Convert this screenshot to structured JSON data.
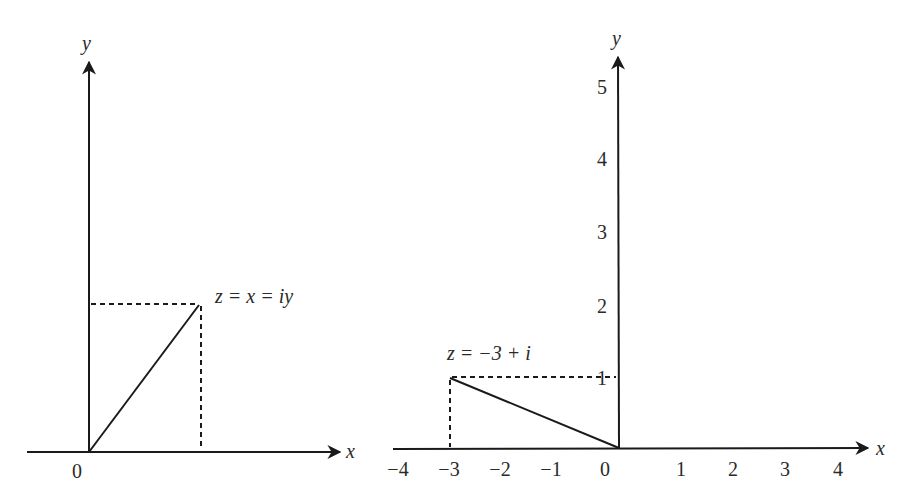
{
  "left_plot": {
    "x_axis_label": "x",
    "y_axis_label": "y",
    "origin_label": "0",
    "point_label": "z = x = iy",
    "point": {
      "x": "x",
      "y": "y"
    }
  },
  "right_plot": {
    "x_axis_label": "x",
    "y_axis_label": "y",
    "x_ticks": [
      "−4",
      "−3",
      "−2",
      "−1",
      "0",
      "1",
      "2",
      "3",
      "4"
    ],
    "y_ticks": [
      "1",
      "2",
      "3",
      "4",
      "5"
    ],
    "point_label": "z = −3 + i",
    "point": {
      "x": -3,
      "y": 1
    }
  },
  "colors": {
    "line": "#1a1a1a",
    "text": "#2a2a2a",
    "background": "#ffffff"
  }
}
